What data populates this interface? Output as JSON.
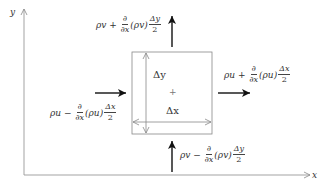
{
  "axes": {
    "x_label": "x",
    "y_label": "y"
  },
  "control_volume": {
    "dy_label": "Δy",
    "dx_label": "Δx",
    "center_mark": "+"
  },
  "fluxes": {
    "top": {
      "base": "ρv",
      "op": "+",
      "num": "∂",
      "den": "∂x",
      "paren": "(ρv)",
      "fnum": "Δy",
      "fden": "2"
    },
    "bottom": {
      "base": "ρv",
      "op": "−",
      "num": "∂",
      "den": "∂x",
      "paren": "(ρv)",
      "fnum": "Δy",
      "fden": "2"
    },
    "left": {
      "base": "ρu",
      "op": "−",
      "num": "∂",
      "den": "∂x",
      "paren": "(ρu)",
      "fnum": "Δx",
      "fden": "2"
    },
    "right": {
      "base": "ρu",
      "op": "+",
      "num": "∂",
      "den": "∂x",
      "paren": "(ρu)",
      "fnum": "Δx",
      "fden": "2"
    }
  }
}
